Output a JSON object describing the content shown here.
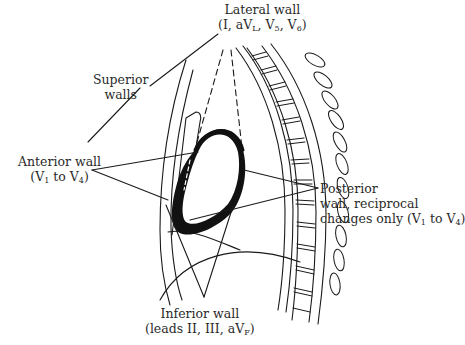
{
  "figure": {
    "type": "anatomical-diagram",
    "colors": {
      "line": "#1a1a1a",
      "text": "#2a2a2a",
      "background": "#ffffff"
    }
  },
  "labels": {
    "lateral": {
      "title": "Lateral wall",
      "leads_prefix": "(I, aV",
      "leads_sub1": "L",
      "leads_mid": ", V",
      "leads_sub2": "5",
      "leads_mid2": ", V",
      "leads_sub3": "6",
      "leads_suffix": ")"
    },
    "superior": {
      "line1": "Superior",
      "line2": "walls"
    },
    "anterior": {
      "title": "Anterior wall",
      "leads_prefix": "(V",
      "leads_sub1": "1",
      "leads_mid": " to V",
      "leads_sub2": "4",
      "leads_suffix": ")"
    },
    "posterior": {
      "line1": "Posterior",
      "line2": "wall, reciprocal",
      "line3_prefix": "changes only (V",
      "line3_sub1": "1",
      "line3_mid": " to V",
      "line3_sub2": "4",
      "line3_suffix": ")"
    },
    "inferior": {
      "title": "Inferior wall",
      "leads_prefix": "(leads II, III, aV",
      "leads_sub1": "F",
      "leads_suffix": ")"
    }
  }
}
